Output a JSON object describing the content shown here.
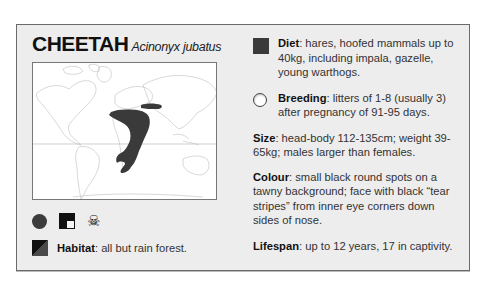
{
  "species": {
    "common_name": "CHEETAH",
    "latin_name": "Acinonyx jubatus"
  },
  "map": {
    "description": "world-distribution-map",
    "range_color": "#3a3a3a",
    "region": "Africa and southwest Asia"
  },
  "status_icons": [
    {
      "name": "circle-icon",
      "color": "#3c3c3c"
    },
    {
      "name": "square-with-notch-icon",
      "color": "#111111"
    },
    {
      "name": "skull-crossbones-icon",
      "glyph": "☠"
    }
  ],
  "habitat": {
    "label": "Habitat",
    "text": ": all but rain forest."
  },
  "facts": {
    "diet": {
      "label": "Diet",
      "text": ": hares, hoofed mammals up to 40kg, including impala, gazelle, young warthogs."
    },
    "breeding": {
      "label": "Breeding",
      "text": ": litters of 1-8 (usually 3) after pregnancy of 91-95 days."
    },
    "size": {
      "label": "Size",
      "text": ": head-body 112-135cm; weight 39-65kg; males larger than females."
    },
    "colour": {
      "label": "Colour",
      "text": ": small black round spots on a tawny background; face with black “tear stripes” from inner eye corners down sides of nose."
    },
    "lifespan": {
      "label": "Lifespan",
      "text": ": up to 12 years, 17 in captivity."
    }
  }
}
